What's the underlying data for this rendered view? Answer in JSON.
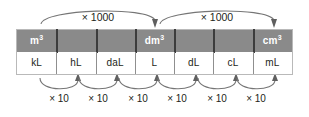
{
  "diagram": {
    "colors": {
      "volume_row_bg": "#8a8a8a",
      "volume_row_text": "#ffffff",
      "capacity_row_bg": "#ffffff",
      "capacity_row_text": "#231f20",
      "divider": "#3c3c3c",
      "arrow": "#6e6e6e",
      "page_bg": "#ffffff"
    },
    "table": {
      "rows": [
        {
          "name": "volume-units",
          "cells": [
            {
              "base": "m",
              "exp": "3",
              "text": "m³"
            },
            {
              "base": "",
              "exp": "",
              "text": ""
            },
            {
              "base": "",
              "exp": "",
              "text": ""
            },
            {
              "base": "dm",
              "exp": "3",
              "text": "dm³"
            },
            {
              "base": "",
              "exp": "",
              "text": ""
            },
            {
              "base": "",
              "exp": "",
              "text": ""
            },
            {
              "base": "cm",
              "exp": "3",
              "text": "cm³"
            }
          ]
        },
        {
          "name": "capacity-units",
          "cells": [
            {
              "text": "kL"
            },
            {
              "text": "hL"
            },
            {
              "text": "daL"
            },
            {
              "text": "L"
            },
            {
              "text": "dL"
            },
            {
              "text": "cL"
            },
            {
              "text": "mL"
            }
          ]
        }
      ]
    },
    "top_arrows": [
      {
        "label": "× 1000",
        "from": "m³",
        "to": "dm³",
        "cx": 98
      },
      {
        "label": "× 1000",
        "from": "dm³",
        "to": "cm³",
        "cx": 217
      }
    ],
    "bottom_arrows": [
      {
        "label": "× 10",
        "from": "kL",
        "to": "hL",
        "cx": 59
      },
      {
        "label": "× 10",
        "from": "hL",
        "to": "daL",
        "cx": 98
      },
      {
        "label": "× 10",
        "from": "daL",
        "to": "L",
        "cx": 138
      },
      {
        "label": "× 10",
        "from": "L",
        "to": "dL",
        "cx": 177
      },
      {
        "label": "× 10",
        "from": "dL",
        "to": "cL",
        "cx": 217
      },
      {
        "label": "× 10",
        "from": "cL",
        "to": "mL",
        "cx": 256
      }
    ]
  }
}
